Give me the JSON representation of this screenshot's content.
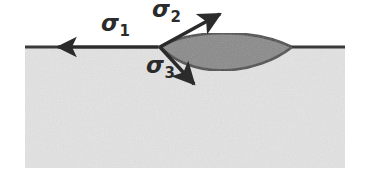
{
  "figure": {
    "width": 365,
    "height": 186,
    "background_color": "#ffffff"
  },
  "substrate": {
    "name": "substrate-block",
    "fill_color": "#e3e3e3",
    "texture": "speckled-noise",
    "x": 25,
    "y": 47,
    "width": 320,
    "height": 121
  },
  "surface_line": {
    "name": "surface-line",
    "color": "#3a3a3a",
    "y": 47,
    "x_start": 25,
    "x_end": 345,
    "thickness": 3
  },
  "inclusion": {
    "name": "lens-inclusion",
    "fill_color": "#8a8a8a",
    "stroke_color": "#4a4a4a",
    "left_tip_x": 160,
    "right_tip_x": 292,
    "tip_y": 47,
    "top_bulge_y": 33,
    "bottom_bulge_y": 79
  },
  "junction": {
    "name": "triple-junction-point",
    "x": 160,
    "y": 47
  },
  "vectors": [
    {
      "id": "sigma1",
      "label_symbol": "σ",
      "label_subscript": "1",
      "direction": "left",
      "from_x": 160,
      "from_y": 47,
      "to_x": 52,
      "to_y": 47,
      "color": "#2b2b2b"
    },
    {
      "id": "sigma2",
      "label_symbol": "σ",
      "label_subscript": "2",
      "direction": "upper-right",
      "from_x": 160,
      "from_y": 47,
      "to_x": 226,
      "to_y": 10,
      "color": "#2b2b2b"
    },
    {
      "id": "sigma3",
      "label_symbol": "σ",
      "label_subscript": "3",
      "direction": "lower-right",
      "from_x": 160,
      "from_y": 47,
      "to_x": 199,
      "to_y": 89,
      "color": "#2b2b2b"
    }
  ],
  "labels": {
    "sigma1": {
      "symbol": "σ",
      "subscript": "1"
    },
    "sigma2": {
      "symbol": "σ",
      "subscript": "2"
    },
    "sigma3": {
      "symbol": "σ",
      "subscript": "3"
    }
  }
}
